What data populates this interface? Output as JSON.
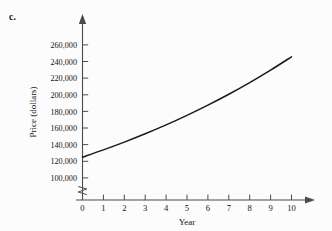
{
  "figure": {
    "part_label": "c.",
    "background_color": "#fcfcfd",
    "axis_color": "#4a4a52",
    "curve_color": "#1b1b1b"
  },
  "chart_data": {
    "type": "line",
    "title": "",
    "subtitle": "",
    "xlabel": "Year",
    "ylabel": "Price (dollars)",
    "x": [
      0,
      1,
      2,
      3,
      4,
      5,
      6,
      7,
      8,
      9,
      10
    ],
    "values": [
      125000,
      133750,
      143100,
      153120,
      163840,
      175340,
      187610,
      200740,
      214790,
      229830,
      245920
    ],
    "series": [
      {
        "name": "Price",
        "values": [
          125000,
          133750,
          143100,
          153120,
          163840,
          175340,
          187610,
          200740,
          214790,
          229830,
          245920
        ]
      }
    ],
    "xlim": [
      0,
      10
    ],
    "ylim": [
      100000,
      260000
    ],
    "xticks": [
      "0",
      "1",
      "2",
      "3",
      "4",
      "5",
      "6",
      "7",
      "8",
      "9",
      "10"
    ],
    "yticks": [
      "100,000",
      "120,000",
      "140,000",
      "160,000",
      "180,000",
      "200,000",
      "220,000",
      "240,000",
      "260,000"
    ],
    "y_axis_break": true,
    "grid": false,
    "legend": "none",
    "annotations": []
  }
}
